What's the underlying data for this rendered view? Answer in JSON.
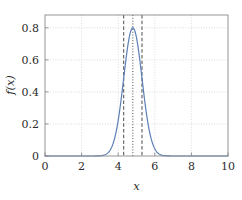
{
  "chart_data": {
    "type": "line",
    "title": "",
    "subtitle": "",
    "xlabel": "x",
    "ylabel": "f(x)",
    "xlim": [
      0,
      10
    ],
    "ylim": [
      0,
      0.88
    ],
    "grid": true,
    "grid_style": "dotted",
    "legend": null,
    "xticks": [
      0,
      2,
      4,
      6,
      8,
      10
    ],
    "xtick_labels": [
      "0",
      "2",
      "4",
      "6",
      "8",
      "10"
    ],
    "yticks": [
      0,
      0.2,
      0.4,
      0.6,
      0.8
    ],
    "ytick_labels": [
      "0",
      "0.2",
      "0.4",
      "0.6",
      "0.8"
    ],
    "series": [
      {
        "name": "f(x)",
        "type": "line",
        "color": "#5b7fb5",
        "linewidth": 1.2,
        "distribution": "gaussian",
        "mu": 4.8,
        "sigma": 0.5,
        "amplitude": 0.8,
        "x": [
          0.0,
          0.5,
          1.0,
          1.5,
          2.0,
          2.5,
          2.8,
          3.0,
          3.2,
          3.4,
          3.6,
          3.8,
          4.0,
          4.2,
          4.4,
          4.6,
          4.8,
          5.0,
          5.2,
          5.4,
          5.6,
          5.8,
          6.0,
          6.2,
          6.4,
          6.6,
          6.8,
          7.0,
          7.5,
          8.0,
          8.5,
          9.0,
          9.5,
          10.0
        ],
        "y": [
          0.0,
          0.0,
          0.0,
          0.0,
          0.0,
          0.0,
          0.001,
          0.003,
          0.007,
          0.016,
          0.035,
          0.069,
          0.125,
          0.205,
          0.306,
          0.415,
          0.513,
          0.576,
          0.594,
          0.565,
          0.497,
          0.404,
          0.303,
          0.208,
          0.13,
          0.074,
          0.038,
          0.018,
          0.002,
          0.0,
          0.0,
          0.0,
          0.0,
          0.0
        ]
      }
    ],
    "vlines": [
      {
        "name": "lower-bound",
        "x": 4.3,
        "style": "dashed",
        "color": "#4a4a4a",
        "linewidth": 1.0
      },
      {
        "name": "mean",
        "x": 4.8,
        "style": "dotted",
        "color": "#4a4a4a",
        "linewidth": 1.0
      },
      {
        "name": "upper-bound",
        "x": 5.3,
        "style": "dashed",
        "color": "#4a4a4a",
        "linewidth": 1.0
      }
    ],
    "peak": {
      "x": 4.8,
      "y": 0.8
    },
    "colors": {
      "curve": "#5b7fb5",
      "grid": "#cfcfcf",
      "axis": "#8a8a8a",
      "text": "#2b2b2b",
      "vline": "#4a4a4a",
      "background": "#ffffff"
    }
  },
  "axis_titles": {
    "x": "x",
    "y": "f(x)"
  }
}
